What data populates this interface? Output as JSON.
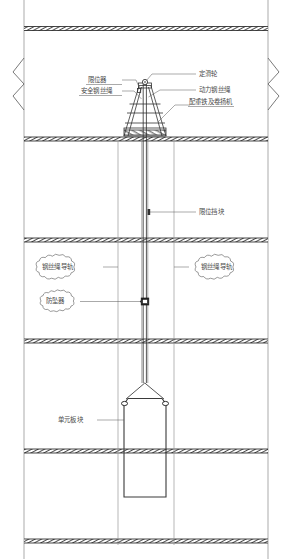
{
  "drawing": {
    "title": "单元板块吊装示意图",
    "type": "engineering-section-drawing"
  },
  "labels": {
    "limit_device": "限位器",
    "safety_wire_rope": "安全钢丝绳",
    "fixed_pulley": "定滑轮",
    "power_wire_rope": "动力钢丝绳",
    "counterweight_winch": "配重铁及卷扬机",
    "limit_block": "限位挡块",
    "wire_rope_guide_left": "钢丝绳导轨",
    "wire_rope_guide_right": "钢丝绳导轨",
    "fall_arrester": "防坠器",
    "unit_panel": "单元板块"
  },
  "colors": {
    "line_dark": "#1a1a1a",
    "line_mid": "#555555",
    "line_light": "#999999",
    "text": "#4a4a4a",
    "background": "#ffffff"
  },
  "geometry": {
    "slab_y_values": [
      28,
      139,
      240,
      341,
      451,
      541
    ],
    "edge_x_left": 24,
    "edge_x_right": 268,
    "rail_x_left": 118,
    "rail_x_right": 174,
    "rope_center_x": 145
  }
}
